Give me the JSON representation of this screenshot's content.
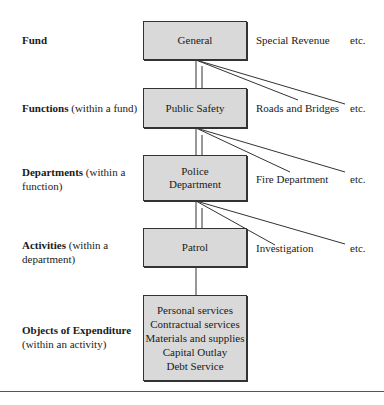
{
  "levels": [
    {
      "label_bold": "Fund",
      "label_rest": "",
      "box": "General",
      "siblings": [
        "Special Revenue",
        "etc."
      ]
    },
    {
      "label_bold": "Functions",
      "label_rest": " (within a fund)",
      "box": "Public Safety",
      "siblings": [
        "Roads and Bridges",
        "etc."
      ]
    },
    {
      "label_bold": "Departments",
      "label_rest": " (within a function)",
      "box_lines": [
        "Police",
        "Department"
      ],
      "siblings": [
        "Fire Department",
        "etc."
      ]
    },
    {
      "label_bold": "Activities",
      "label_rest": " (within a department)",
      "box": "Patrol",
      "siblings": [
        "Investigation",
        "etc."
      ]
    },
    {
      "label_bold": "Objects of Expenditure",
      "label_rest": "(within an activity)",
      "box_lines": [
        "Personal services",
        "Contractual services",
        "Materials and supplies",
        "Capital Outlay",
        "Debt Service"
      ]
    }
  ]
}
